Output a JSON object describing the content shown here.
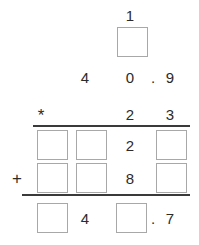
{
  "worksheet": {
    "type": "vertical-multiplication-worksheet",
    "problem": "40.9 x 23",
    "operator_multiply": "*",
    "operator_add": "+",
    "decimal_point": ".",
    "carry_row": {
      "digits": [
        "1"
      ],
      "blank_boxes": 1
    },
    "multiplicand": {
      "digits": [
        "4",
        "0",
        ".",
        "9"
      ]
    },
    "multiplier": {
      "operator": "*",
      "digits": [
        "2",
        "3"
      ]
    },
    "partial_product_1": {
      "digits": [
        "2"
      ],
      "blank_boxes": 3
    },
    "partial_product_2": {
      "operator": "+",
      "digits": [
        "8"
      ],
      "blank_boxes": 3
    },
    "total": {
      "digits": [
        "4",
        ".",
        "7"
      ],
      "blank_boxes": 2
    },
    "colors": {
      "digit": "#2b2b2b",
      "box_border": "#a8a8a8",
      "rule": "#3a3a3a",
      "background": "#ffffff"
    }
  }
}
